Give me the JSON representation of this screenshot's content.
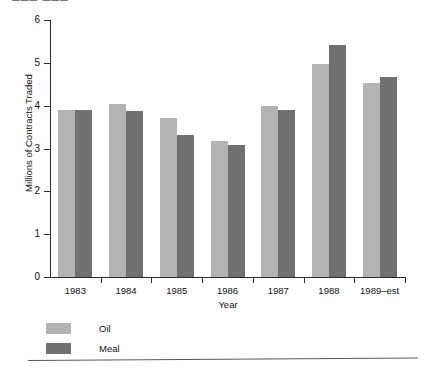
{
  "top_remnant": "▀▀▀ ▀▀▀",
  "colors": {
    "oil": "#b3b3b3",
    "meal": "#707070",
    "axis": "#2b2b2b",
    "text": "#111111",
    "rule": "#5a5a5a"
  },
  "chart_data": {
    "type": "bar",
    "title": "",
    "subtitle": "",
    "xlabel": "Year",
    "ylabel": "Millions of Contracts Traded",
    "categories": [
      "1983",
      "1984",
      "1985",
      "1986",
      "1987",
      "1988",
      "1989–est"
    ],
    "series": [
      {
        "name": "Oil",
        "color": "#b3b3b3",
        "values": [
          3.9,
          4.05,
          3.72,
          3.18,
          4.0,
          4.97,
          4.52
        ]
      },
      {
        "name": "Meal",
        "color": "#707070",
        "values": [
          3.9,
          3.88,
          3.32,
          3.08,
          3.9,
          5.42,
          4.68
        ]
      }
    ],
    "ylim": [
      0,
      6
    ],
    "yticks": [
      0,
      1,
      2,
      3,
      4,
      5,
      6
    ],
    "ytick_labels": [
      "0",
      "1",
      "2",
      "3",
      "4",
      "5",
      "6"
    ],
    "grid": false,
    "legend_position": "below-left",
    "legend": [
      "Oil",
      "Meal"
    ]
  },
  "axis": {
    "y_title": "Millions of Contracts Traded",
    "x_title": "Year"
  },
  "legend": {
    "items": [
      {
        "label": "Oil"
      },
      {
        "label": "Meal"
      }
    ]
  }
}
